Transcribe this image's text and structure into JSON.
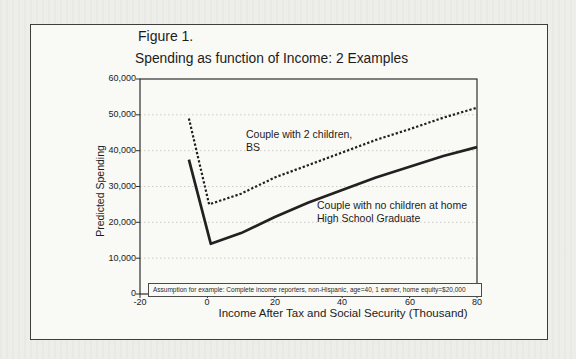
{
  "figure": {
    "title_line1": "Figure 1.",
    "title_line2": "Spending as function of Income: 2 Examples"
  },
  "chart_data": {
    "type": "line",
    "title": "Spending as function of Income: 2 Examples",
    "xlabel": "Income After Tax and Social Security (Thousand)",
    "ylabel": "Predicted Spending",
    "xlim": [
      -20,
      80
    ],
    "ylim": [
      0,
      60000
    ],
    "x_ticks": [
      -20,
      0,
      20,
      40,
      60,
      80
    ],
    "y_ticks": [
      0,
      10000,
      20000,
      30000,
      40000,
      50000,
      60000
    ],
    "grid": "horizontal dotted gridlines at each 10,000",
    "legend_position": "inline labels next to lines",
    "annotation": "Assumption for example: Complete income reporters,  non-Hispanic, age=40, 1 earner, home equity=$20,000",
    "series": [
      {
        "name": "Couple with 2 children, BS",
        "style": "dashed",
        "x": [
          -5.5,
          0.5,
          10,
          20,
          30,
          40,
          50,
          60,
          70,
          80
        ],
        "y": [
          49000,
          25000,
          28000,
          32500,
          36000,
          39500,
          43000,
          46000,
          49200,
          52000
        ]
      },
      {
        "name": "Couple with no children at home, High School Graduate",
        "style": "solid",
        "x": [
          -5.5,
          1,
          10,
          20,
          30,
          40,
          50,
          60,
          70,
          80
        ],
        "y": [
          37500,
          14000,
          17000,
          21500,
          25500,
          29000,
          32500,
          35500,
          38500,
          41000
        ]
      }
    ]
  },
  "axes": {
    "y_tick_labels": [
      "60,000",
      "50,000",
      "40,000",
      "30,000",
      "20,000",
      "10,000",
      "0"
    ],
    "x_tick_labels": [
      "-20",
      "0",
      "20",
      "40",
      "60",
      "80"
    ],
    "x_axis_title": "Income After Tax and Social Security (Thousand)",
    "y_axis_title": "Predicted Spending"
  },
  "labels": {
    "series1_line1": "Couple with 2 children,",
    "series1_line2": "BS",
    "series2_line1": "Couple with no children at home",
    "series2_line2": "High School Graduate",
    "annotation": "Assumption for example: Complete income reporters,  non-Hispanic, age=40, 1 earner, home equity=$20,000"
  },
  "colors": {
    "line": "#212121",
    "grid": "#c6c6c2",
    "frame": "#2e2e2e",
    "paper": "#f9f9f6",
    "page": "#ededea"
  }
}
